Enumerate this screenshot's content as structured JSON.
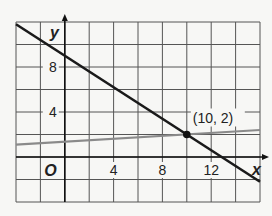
{
  "chart_data": {
    "type": "line",
    "title": "",
    "xlabel": "x",
    "ylabel": "y",
    "xlim": [
      -4,
      16
    ],
    "ylim": [
      -4,
      12
    ],
    "grid": true,
    "grid_step": 2,
    "x_tick_labels": [
      {
        "value": 4,
        "label": "4"
      },
      {
        "value": 8,
        "label": "8"
      },
      {
        "value": 12,
        "label": "12"
      }
    ],
    "y_tick_labels": [
      {
        "value": 4,
        "label": "4"
      },
      {
        "value": 8,
        "label": "8"
      }
    ],
    "origin_label": "O",
    "series": [
      {
        "name": "line-1",
        "color": "#1a1a1a",
        "points": [
          [
            -4,
            11.8
          ],
          [
            16,
            -2.2
          ]
        ]
      },
      {
        "name": "line-2",
        "color": "#8a8a8a",
        "points": [
          [
            -4,
            1.1
          ],
          [
            16,
            2.4
          ]
        ]
      }
    ],
    "annotations": [
      {
        "text": "(10, 2)",
        "x": 10,
        "y": 2,
        "marker": "point"
      }
    ]
  }
}
